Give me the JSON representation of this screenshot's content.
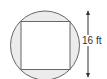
{
  "diagram": {
    "shape": "square inscribed in circle",
    "dimension_label": "16 ft",
    "dimension_orientation": "vertical",
    "colors": {
      "stroke": "#666666",
      "shaded_region": "#ececec",
      "square_fill": "#ffffff",
      "arrow": "#333333"
    }
  }
}
